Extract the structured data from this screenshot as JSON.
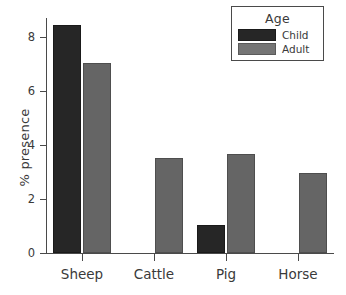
{
  "chart_data": {
    "type": "bar",
    "title": "",
    "xlabel": "",
    "ylabel": "% presence",
    "categories": [
      "Sheep",
      "Cattle",
      "Pig",
      "Horse"
    ],
    "series": [
      {
        "name": "Child",
        "color": "#262626",
        "values": [
          8.45,
          0,
          1.05,
          0
        ]
      },
      {
        "name": "Adult",
        "color": "#656565",
        "values": [
          7.05,
          3.5,
          3.65,
          2.95
        ]
      }
    ],
    "ylim": [
      0,
      8.7
    ],
    "yticks": [
      0,
      2,
      4,
      6,
      8
    ],
    "ytick_labels": [
      "0",
      "2",
      "4",
      "6",
      "8"
    ],
    "grid": false,
    "legend": {
      "title": "Age",
      "position": "top-right",
      "entries": [
        {
          "label": "Child",
          "color": "#262626"
        },
        {
          "label": "Adult",
          "color": "#757575"
        }
      ]
    }
  }
}
